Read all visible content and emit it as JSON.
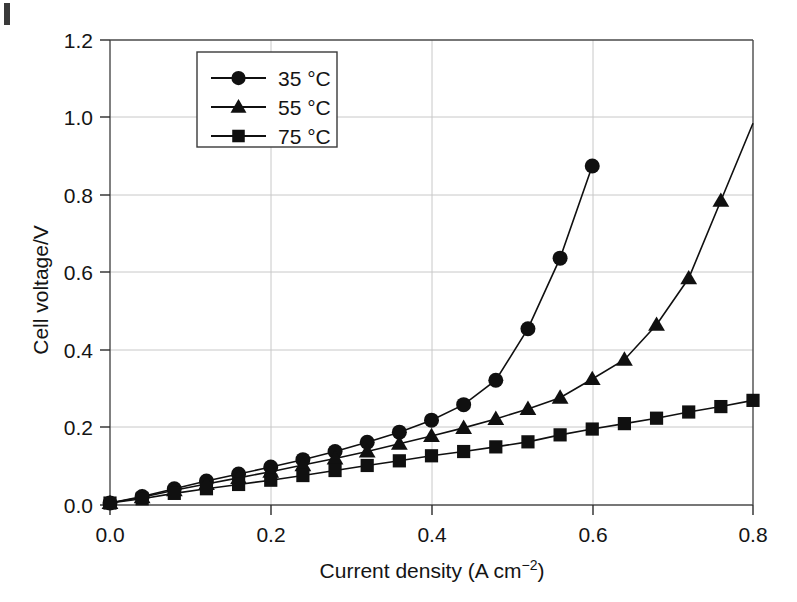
{
  "chart_data": {
    "type": "line",
    "title": "",
    "xlabel": "Current density (A cm⁻²)",
    "ylabel": "Cell voltage/V",
    "xlim": [
      0.0,
      0.8
    ],
    "ylim": [
      0.0,
      1.2
    ],
    "xticks": [
      "0.0",
      "0.2",
      "0.4",
      "0.6",
      "0.8"
    ],
    "xtick_values": [
      0.0,
      0.2,
      0.4,
      0.6,
      0.8
    ],
    "yticks": [
      "0.0",
      "0.2",
      "0.4",
      "0.6",
      "0.8",
      "1.0",
      "1.2"
    ],
    "ytick_values": [
      0.0,
      0.2,
      0.4,
      0.6,
      0.8,
      1.0,
      1.2
    ],
    "grid": true,
    "grid_color": "#c8c8c8",
    "legend_position": "upper center",
    "line_color": "#1a1a1a",
    "series": [
      {
        "name": "35 °C",
        "marker": "circle",
        "color": "#101010",
        "x": [
          0.0,
          0.04,
          0.08,
          0.12,
          0.16,
          0.2,
          0.24,
          0.28,
          0.32,
          0.36,
          0.4,
          0.44,
          0.48,
          0.52,
          0.56,
          0.6
        ],
        "y": [
          0.005,
          0.022,
          0.042,
          0.062,
          0.08,
          0.098,
          0.117,
          0.138,
          0.162,
          0.188,
          0.219,
          0.259,
          0.322,
          0.455,
          0.637,
          0.875
        ]
      },
      {
        "name": "55 °C",
        "marker": "triangle",
        "color": "#101010",
        "x": [
          0.0,
          0.04,
          0.08,
          0.12,
          0.16,
          0.2,
          0.24,
          0.28,
          0.32,
          0.36,
          0.4,
          0.44,
          0.48,
          0.52,
          0.56,
          0.6,
          0.64,
          0.68,
          0.72,
          0.76,
          0.8
        ],
        "y": [
          0.005,
          0.02,
          0.038,
          0.054,
          0.07,
          0.086,
          0.103,
          0.12,
          0.138,
          0.158,
          0.178,
          0.199,
          0.222,
          0.248,
          0.277,
          0.325,
          0.375,
          0.465,
          0.585,
          0.785,
          0.985
        ]
      },
      {
        "name": "75 °C",
        "marker": "square",
        "color": "#101010",
        "x": [
          0.0,
          0.04,
          0.08,
          0.12,
          0.16,
          0.2,
          0.24,
          0.28,
          0.32,
          0.36,
          0.4,
          0.44,
          0.48,
          0.52,
          0.56,
          0.6,
          0.64,
          0.68,
          0.72,
          0.76,
          0.8
        ],
        "y": [
          0.005,
          0.016,
          0.03,
          0.042,
          0.053,
          0.064,
          0.076,
          0.089,
          0.102,
          0.114,
          0.127,
          0.138,
          0.15,
          0.163,
          0.181,
          0.196,
          0.21,
          0.224,
          0.24,
          0.254,
          0.27
        ]
      }
    ]
  },
  "legend": {
    "entries": [
      {
        "label": "35 °C",
        "marker": "circle-marker-icon"
      },
      {
        "label": "55 °C",
        "marker": "triangle-marker-icon"
      },
      {
        "label": "75 °C",
        "marker": "square-marker-icon"
      }
    ]
  },
  "axes": {
    "x_title": "Current density (A cm⁻²)",
    "x_title_main": "Current density (A cm",
    "x_title_sup": "−2",
    "x_title_tail": ")",
    "y_title": "Cell voltage/V"
  }
}
